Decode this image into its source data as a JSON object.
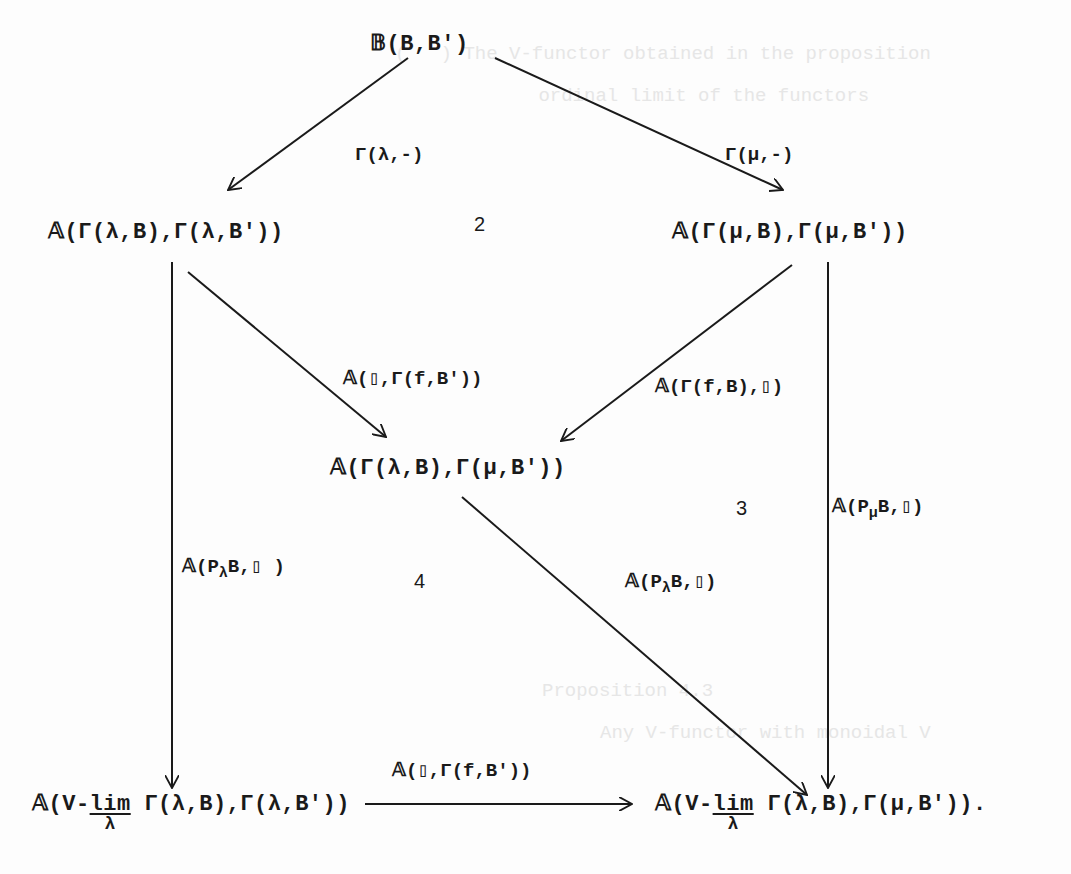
{
  "diagram": {
    "type": "commutative-diagram",
    "nodes": {
      "top": "𝔹(B,B′)",
      "left": "𝔸(Γ(λ,B),Γ(λ,B′))",
      "right": "𝔸(Γ(μ,B),Γ(μ,B′))",
      "middle": "𝔸(Γ(λ,B),Γ(μ,B′))",
      "bottom_left_prefix": "𝔸(V-",
      "bottom_left_lim": "lim",
      "bottom_left_lim_sub": "λ",
      "bottom_left_suffix": " Γ(λ,B),Γ(λ,B′))",
      "bottom_right_prefix": "𝔸(V-",
      "bottom_right_lim": "lim",
      "bottom_right_lim_sub": "λ",
      "bottom_right_suffix": " Γ(λ,B),Γ(μ,B′))."
    },
    "arrow_labels": {
      "top_to_left": "Γ(λ,-)",
      "top_to_right": "Γ(μ,-)",
      "left_to_middle": "𝔸(▯,Γ(f,B′))",
      "right_to_middle": "𝔸(Γ(f,B),▯)",
      "right_to_bottom_right_prefix": "𝔸(P",
      "right_to_bottom_right_sub": "μ",
      "right_to_bottom_right_suffix": "B,▯)",
      "left_to_bottom_left_prefix": "𝔸(P",
      "left_to_bottom_left_sub": "λ",
      "left_to_bottom_left_suffix": "B,▯ )",
      "middle_to_bottom_right_prefix": "𝔸(P",
      "middle_to_bottom_right_sub": "λ",
      "middle_to_bottom_right_suffix": "B,▯)",
      "bottom_left_to_bottom_right": "𝔸(▯,Γ(f,B′))"
    },
    "region_numbers": {
      "r2": "2",
      "r3": "3",
      "r4": "4"
    }
  },
  "ghost_text": {
    "line1": "(   ) The V-functor obtained in the proposition",
    "line2": "      ordinal limit of the functors          ",
    "line3": "Proposition 4.3",
    "line4": "Any V-functor with monoidal V"
  }
}
